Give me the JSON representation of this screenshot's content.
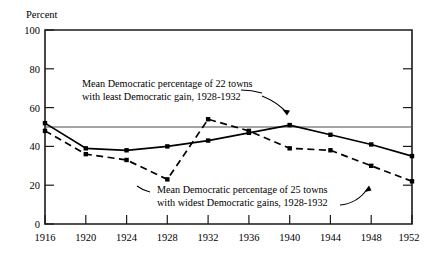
{
  "chart_data": {
    "type": "line",
    "title": "",
    "xlabel": "",
    "ylabel": "Percent",
    "ylim": [
      0,
      100
    ],
    "yticks": [
      0,
      20,
      40,
      60,
      80,
      100
    ],
    "categories": [
      "1916",
      "1920",
      "1924",
      "1928",
      "1932",
      "1936",
      "1940",
      "1944",
      "1948",
      "1952"
    ],
    "x": [
      1916,
      1920,
      1924,
      1928,
      1932,
      1936,
      1940,
      1944,
      1948,
      1952
    ],
    "grid": false,
    "legend_position": "none",
    "reference_lines": [
      {
        "name": "fifty-percent-line",
        "axis": "y",
        "value": 50
      }
    ],
    "series": [
      {
        "name": "Mean Democratic percentage of 22 towns with least Democratic gain, 1928-1932",
        "style": "solid",
        "values": [
          52,
          39,
          38,
          40,
          43,
          47,
          51,
          46,
          41,
          35
        ]
      },
      {
        "name": "Mean Democratic percentage of 25 towns with widest Democratic gains, 1928-1932",
        "style": "dashed",
        "values": [
          48,
          36,
          33,
          23,
          54,
          48,
          39,
          38,
          30,
          22
        ]
      }
    ],
    "annotations": [
      {
        "id": "annotation-least-gain",
        "line1": "Mean Democratic percentage of  22 towns",
        "line2": "with least Democratic gain, 1928-1932",
        "points_to": {
          "x": 1940,
          "y": 51
        }
      },
      {
        "id": "annotation-widest-gains",
        "line1": "Mean Democratic percentage of  25 towns",
        "line2": "with widest Democratic gains, 1928-1932",
        "points_to": {
          "x": 1948,
          "y": 30
        }
      }
    ]
  },
  "axis": {
    "y_title": "Percent",
    "y_labels": [
      "100",
      "80",
      "60",
      "40",
      "20",
      "0"
    ],
    "x_labels": [
      "1916",
      "1920",
      "1924",
      "1928",
      "1932",
      "1936",
      "1940",
      "1944",
      "1948",
      "1952"
    ]
  },
  "annotations": {
    "upper": {
      "line1": "Mean Democratic percentage of  22 towns",
      "line2": "with least Democratic gain, 1928-1932"
    },
    "lower": {
      "line1": "Mean Democratic percentage of  25 towns",
      "line2": "with widest Democratic gains, 1928-1932"
    }
  },
  "colors": {
    "ink": "#000000",
    "frame": "#1a1a1a",
    "reference": "#4d4d4d",
    "background": "#ffffff"
  }
}
